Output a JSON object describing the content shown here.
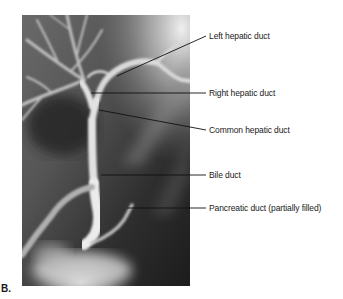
{
  "figure": {
    "panel_letter": "B.",
    "image_description": "Cholangiogram X-ray showing biliary tree",
    "labels": [
      {
        "id": "left-hepatic-duct",
        "text": "Left hepatic duct"
      },
      {
        "id": "right-hepatic-duct",
        "text": "Right hepatic duct"
      },
      {
        "id": "common-hepatic-duct",
        "text": "Common hepatic duct"
      },
      {
        "id": "bile-duct",
        "text": "Bile duct"
      },
      {
        "id": "pancreatic-duct",
        "text": "Pancreatic duct (partially filled)"
      }
    ]
  }
}
